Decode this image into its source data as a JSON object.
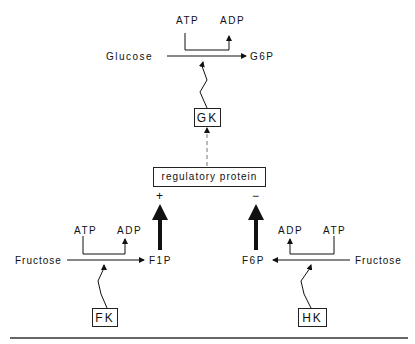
{
  "diagram": {
    "top_caption_cutoff": "",
    "glucose_reaction": {
      "substrate": "Glucose",
      "product": "G6P",
      "cofactor_in": "ATP",
      "cofactor_out": "ADP",
      "enzyme": "GK"
    },
    "regulator": {
      "label": "regulatory protein",
      "activation_sign": "+",
      "inhibition_sign": "−"
    },
    "fructose_fk_reaction": {
      "substrate": "Fructose",
      "product": "F1P",
      "cofactor_in": "ATP",
      "cofactor_out": "ADP",
      "enzyme": "FK"
    },
    "fructose_hk_reaction": {
      "substrate": "Fructose",
      "product": "F6P",
      "cofactor_in": "ATP",
      "cofactor_out": "ADP",
      "enzyme": "HK"
    },
    "colors": {
      "ink": "#111111",
      "background": "#ffffff"
    }
  }
}
